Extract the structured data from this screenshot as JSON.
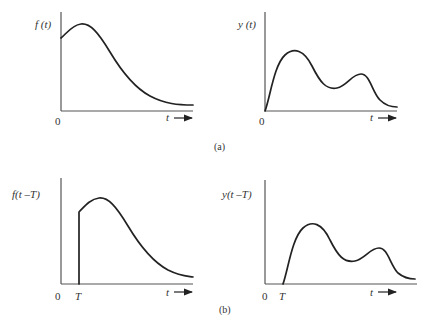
{
  "figure": {
    "panel_a": {
      "caption": "(a)",
      "input": {
        "ylabel": "f (t)",
        "origin_label": "0",
        "xlabel": "t",
        "description": "Input signal starting at nonzero value at t=0, single peak, decaying toward zero"
      },
      "output": {
        "ylabel": "y (t)",
        "origin_label": "0",
        "xlabel": "t",
        "description": "Output response starting at zero, two peaks, decaying toward zero"
      }
    },
    "panel_b": {
      "caption": "(b)",
      "input": {
        "ylabel": "f(t –T)",
        "origin_label": "0",
        "delay_label": "T",
        "xlabel": "t",
        "description": "Input signal delayed by T; zero until T, then jumps and follows same shape"
      },
      "output": {
        "ylabel": "y(t –T)",
        "origin_label": "0",
        "delay_label": "T",
        "xlabel": "t",
        "description": "Output response delayed by T; same shape shifted right"
      }
    },
    "colors": {
      "curve": "#222222",
      "axis": "#555555",
      "background": "#ffffff"
    }
  }
}
